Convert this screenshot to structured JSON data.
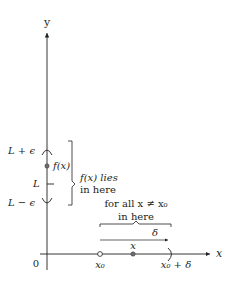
{
  "diagram": {
    "axes": {
      "y_label": "y",
      "x_label": "x",
      "origin_label": "0"
    },
    "y_axis_labels": {
      "upper": "L + ϵ",
      "middle": "L",
      "lower": "L − ϵ",
      "point": "f(x)"
    },
    "y_bracket_text": {
      "line1": "f(x) lies",
      "line2": "in here"
    },
    "x_axis_labels": {
      "center": "x₀",
      "point": "x",
      "right": "x₀ + δ"
    },
    "x_brace_text": {
      "line1": "for all x ≠ x₀",
      "line2": "in here"
    },
    "delta_label": "δ",
    "colors": {
      "stroke": "#231f20",
      "point_fill": "#6d6e71",
      "open_point_fill": "#ffffff"
    }
  }
}
